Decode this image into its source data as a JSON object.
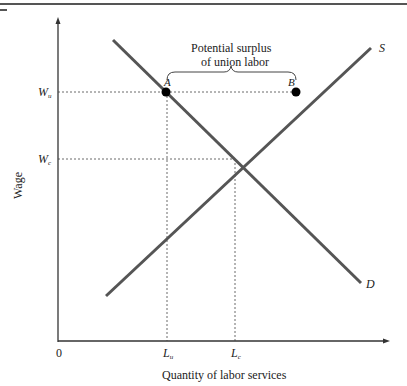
{
  "diagram": {
    "title": "",
    "x_axis_label": "Quantity of labor services",
    "y_axis_label": "Wage",
    "origin_label": "0",
    "y_ticks": [
      {
        "main": "W",
        "sub": "u"
      },
      {
        "main": "W",
        "sub": "c"
      }
    ],
    "x_ticks": [
      {
        "main": "L",
        "sub": "u"
      },
      {
        "main": "L",
        "sub": "c"
      }
    ],
    "curves": {
      "supply": "S",
      "demand": "D"
    },
    "points": {
      "a": "A",
      "b": "B"
    },
    "brace_annotation_line1": "Potential surplus",
    "brace_annotation_line2": "of union labor"
  }
}
